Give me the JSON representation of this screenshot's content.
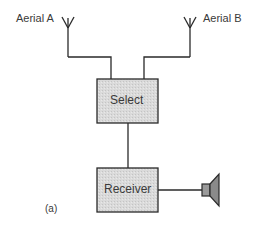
{
  "diagram": {
    "aerial_a_label": "Aerial A",
    "aerial_b_label": "Aerial B",
    "select_label": "Select",
    "receiver_label": "Receiver",
    "caption": "(a)",
    "colors": {
      "line": "#2a2a2a",
      "box_fill": "#d4d4d4",
      "speaker_fill": "#8a8a8a"
    }
  }
}
